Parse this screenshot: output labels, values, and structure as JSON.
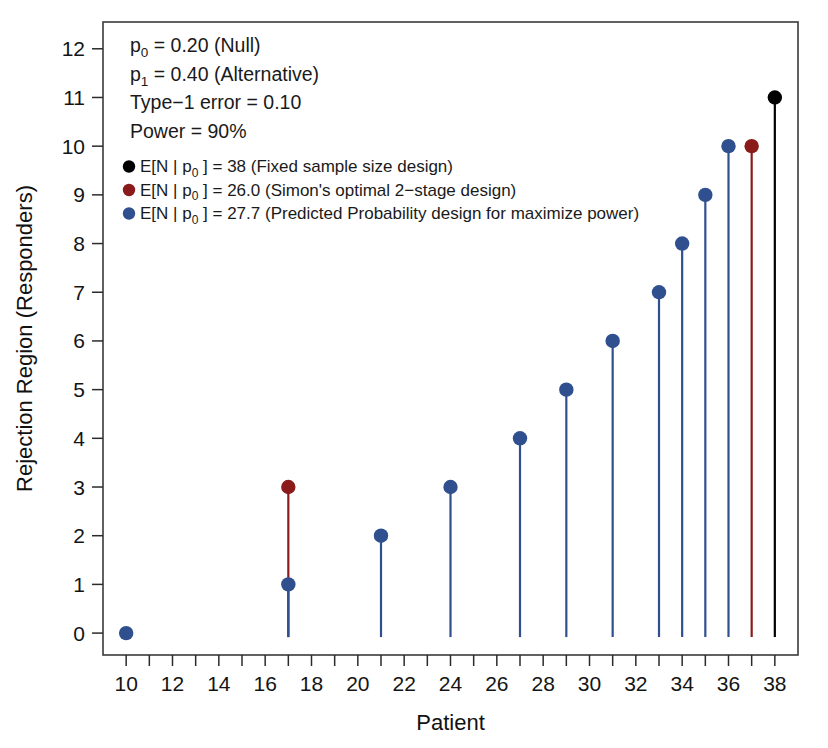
{
  "chart_data": {
    "type": "scatter",
    "title": "",
    "xlabel": "Patient",
    "ylabel": "Rejection Region (Responders)",
    "xlim": [
      9.0,
      39.0
    ],
    "ylim": [
      -0.45,
      12.55
    ],
    "grid": false,
    "legend_position": "top-left",
    "x_ticks": [
      10,
      11,
      12,
      13,
      14,
      15,
      16,
      17,
      18,
      19,
      20,
      21,
      22,
      23,
      24,
      25,
      26,
      27,
      28,
      29,
      30,
      31,
      32,
      33,
      34,
      35,
      36,
      37,
      38
    ],
    "x_tick_labels": [
      "10",
      "",
      "12",
      "",
      "14",
      "",
      "16",
      "",
      "18",
      "",
      "20",
      "",
      "22",
      "",
      "24",
      "",
      "26",
      "",
      "28",
      "",
      "30",
      "",
      "32",
      "",
      "34",
      "",
      "36",
      "",
      "38"
    ],
    "y_ticks": [
      0,
      1,
      2,
      3,
      4,
      5,
      6,
      7,
      8,
      9,
      10,
      11,
      12
    ],
    "y_tick_labels": [
      "0",
      "1",
      "2",
      "3",
      "4",
      "5",
      "6",
      "7",
      "8",
      "9",
      "10",
      "11",
      "12"
    ],
    "series": [
      {
        "name": "Fixed sample size design",
        "color": "#000000",
        "marker": "filled-circle",
        "style": "stem",
        "points": [
          {
            "x": 38,
            "y": 11
          }
        ]
      },
      {
        "name": "Simon's optimal 2-stage design",
        "color": "#8B1A1A",
        "marker": "filled-circle",
        "style": "stem",
        "points": [
          {
            "x": 17,
            "y": 3
          },
          {
            "x": 37,
            "y": 10
          }
        ]
      },
      {
        "name": "Predicted Probability design for maximize power",
        "color": "#2F4F8F",
        "marker": "filled-circle",
        "style": "stem",
        "points": [
          {
            "x": 10,
            "y": 0
          },
          {
            "x": 17,
            "y": 1
          },
          {
            "x": 21,
            "y": 2
          },
          {
            "x": 24,
            "y": 3
          },
          {
            "x": 27,
            "y": 4
          },
          {
            "x": 29,
            "y": 5
          },
          {
            "x": 31,
            "y": 6
          },
          {
            "x": 33,
            "y": 7
          },
          {
            "x": 34,
            "y": 8
          },
          {
            "x": 35,
            "y": 9
          },
          {
            "x": 36,
            "y": 10
          }
        ]
      }
    ]
  },
  "annotations": {
    "design_parameters": [
      {
        "id": "p0",
        "prefix": "p",
        "sub": "0",
        "rest": " = 0.20 (Null)"
      },
      {
        "id": "p1",
        "prefix": "p",
        "sub": "1",
        "rest": " = 0.40 (Alternative)"
      },
      {
        "id": "type1",
        "prefix": "Type−1 error = 0.10",
        "sub": "",
        "rest": ""
      },
      {
        "id": "power",
        "prefix": "Power = 90%",
        "sub": "",
        "rest": ""
      }
    ]
  },
  "legend": {
    "entries": [
      {
        "id": "fixed",
        "color": "#000000",
        "prefix": "E[N | p",
        "sub": "0",
        "rest": " ] = 38 (Fixed sample size design)"
      },
      {
        "id": "simon",
        "color": "#8B1A1A",
        "prefix": "E[N | p",
        "sub": "0",
        "rest": " ] = 26.0 (Simon's optimal 2−stage design)"
      },
      {
        "id": "predprob",
        "color": "#2F4F8F",
        "prefix": "E[N | p",
        "sub": "0",
        "rest": " ] = 27.7 (Predicted Probability design for maximize power)"
      }
    ]
  },
  "colors": {
    "black_series": "#000000",
    "red_series": "#8B1A1A",
    "blue_series": "#2F4F8F",
    "axis": "#2b2b2b",
    "background": "#ffffff"
  }
}
